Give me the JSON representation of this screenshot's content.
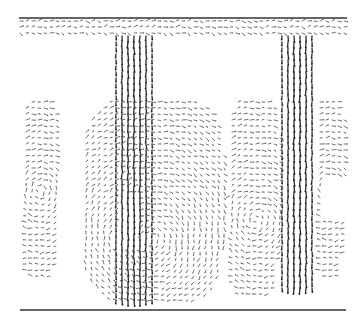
{
  "figure": {
    "type": "vector-field",
    "colors": {
      "background": "#ffffff",
      "arrow": "#2a2a2a",
      "arrow_light": "#6a6a6a",
      "boundary": "#333333"
    },
    "boundaries": [
      {
        "name": "top-wall",
        "x1": 19,
        "y1": 18,
        "x2": 347,
        "y2": 18
      },
      {
        "name": "bottom-wall",
        "x1": 20,
        "y1": 310,
        "x2": 346,
        "y2": 310
      }
    ],
    "grid_spacing": 6,
    "regions": [
      {
        "name": "top-band",
        "x": [
          20,
          346
        ],
        "y": [
          21,
          38
        ],
        "dir": "h",
        "strength": 0.6
      },
      {
        "name": "jet-1",
        "x": [
          116,
          152
        ],
        "y": [
          36,
          300
        ],
        "dir": "down",
        "strength": 1.0
      },
      {
        "name": "jet-2",
        "x": [
          282,
          314
        ],
        "y": [
          36,
          292
        ],
        "dir": "down",
        "strength": 1.0
      },
      {
        "name": "left-recirculation",
        "x": [
          20,
          60
        ],
        "y": [
          96,
          282
        ],
        "dir": "swirl",
        "strength": 0.4,
        "cx": 40,
        "cy": 190
      },
      {
        "name": "center-recirculation",
        "x": [
          80,
          226
        ],
        "y": [
          96,
          306
        ],
        "dir": "swirl",
        "strength": 0.45,
        "cx": 150,
        "cy": 240,
        "hole": {
          "x": [
            118,
            136
          ],
          "y": [
            196,
            246
          ]
        }
      },
      {
        "name": "right-mid-recirculation",
        "x": [
          226,
          282
        ],
        "y": [
          96,
          300
        ],
        "dir": "swirl",
        "strength": 0.45,
        "cx": 256,
        "cy": 220
      },
      {
        "name": "far-right-recirculation",
        "x": [
          314,
          346
        ],
        "y": [
          96,
          280
        ],
        "dir": "swirl",
        "strength": 0.4,
        "cx": 330,
        "cy": 190,
        "hole": {
          "x": [
            326,
            346
          ],
          "y": [
            180,
            220
          ]
        }
      }
    ]
  }
}
